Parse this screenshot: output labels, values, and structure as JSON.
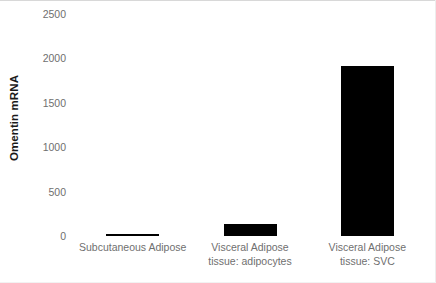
{
  "chart_data": {
    "type": "bar",
    "title": "",
    "xlabel": "",
    "ylabel": "Omentin mRNA",
    "categories": [
      "Subcutaneous Adipose",
      "Visceral Adipose tissue: adipocytes",
      "Visceral Adipose tissue: SVC"
    ],
    "category_lines": [
      [
        "Subcutaneous Adipose"
      ],
      [
        "Visceral Adipose",
        "tissue: adipocytes"
      ],
      [
        "Visceral Adipose",
        "tissue: SVC"
      ]
    ],
    "values": [
      25,
      140,
      1920
    ],
    "ylim": [
      0,
      2500
    ],
    "yticks": [
      0,
      500,
      1000,
      1500,
      2000,
      2500
    ],
    "ytick_labels": [
      "0",
      "500",
      "1000",
      "1500",
      "2000",
      "2500"
    ],
    "grid": false,
    "legend": false,
    "bar_color": "#000000",
    "background_color": "#ffffff",
    "tick_label_color": "#6f6f6f",
    "axis_title_color": "#1a1a1a"
  }
}
